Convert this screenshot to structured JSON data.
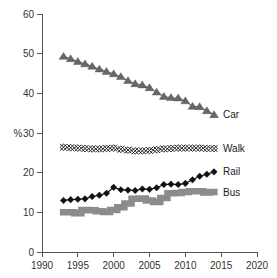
{
  "chart_data": {
    "type": "line",
    "title": "",
    "xlabel": "",
    "ylabel": "%",
    "xlim": [
      1990,
      2020
    ],
    "ylim": [
      0,
      60
    ],
    "xticks": [
      1990,
      1995,
      2000,
      2005,
      2010,
      2015,
      2020
    ],
    "yticks": [
      0,
      10,
      20,
      30,
      40,
      50,
      60
    ],
    "grid": false,
    "legend_position": "right-of-line-end",
    "x": [
      1993,
      1994,
      1995,
      1996,
      1997,
      1998,
      1999,
      2000,
      2001,
      2002,
      2003,
      2004,
      2005,
      2006,
      2007,
      2008,
      2009,
      2010,
      2011,
      2012,
      2013,
      2014
    ],
    "series": [
      {
        "name": "Car",
        "label": "Car",
        "color": "#676767",
        "marker": "triangle",
        "style": "line-marker",
        "values": [
          49.3,
          48.7,
          48.0,
          47.4,
          46.8,
          46.1,
          45.5,
          44.9,
          44.2,
          43.2,
          42.4,
          42.1,
          41.4,
          40.3,
          39.2,
          38.9,
          38.8,
          38.1,
          36.7,
          36.6,
          35.6,
          34.6
        ]
      },
      {
        "name": "Walk",
        "label": "Walk",
        "color": "#111111",
        "marker": "diamond-cross",
        "style": "line-marker",
        "values": [
          26.4,
          26.3,
          26.2,
          26.1,
          26.0,
          26.0,
          26.1,
          26.2,
          25.9,
          25.7,
          25.5,
          25.5,
          25.6,
          25.8,
          26.0,
          26.1,
          26.2,
          26.2,
          26.2,
          26.2,
          26.1,
          26.1
        ]
      },
      {
        "name": "Rail",
        "label": "Rail",
        "color": "#111111",
        "marker": "diamond",
        "style": "line-marker",
        "values": [
          13.0,
          13.2,
          13.3,
          13.4,
          14.0,
          14.3,
          14.8,
          16.3,
          15.7,
          15.6,
          15.5,
          15.9,
          15.8,
          16.2,
          17.0,
          17.1,
          17.0,
          17.3,
          18.2,
          19.1,
          19.6,
          20.2
        ]
      },
      {
        "name": "Bus",
        "label": "Bus",
        "color": "#8c8c8c",
        "marker": "none",
        "style": "thick-step",
        "values": [
          10.0,
          10.0,
          9.8,
          10.6,
          10.5,
          10.3,
          10.1,
          10.6,
          11.3,
          12.2,
          13.4,
          13.5,
          13.0,
          12.6,
          13.6,
          14.8,
          14.9,
          15.1,
          15.3,
          15.3,
          15.0,
          15.1
        ]
      }
    ]
  },
  "axis": {
    "ylabel": "%",
    "xtick_labels": [
      "1990",
      "1995",
      "2000",
      "2005",
      "2010",
      "2015",
      "2020"
    ],
    "ytick_labels": [
      "0",
      "10",
      "20",
      "30",
      "40",
      "50",
      "60"
    ]
  },
  "labels": {
    "car": "Car",
    "walk": "Walk",
    "rail": "Rail",
    "bus": "Bus"
  }
}
